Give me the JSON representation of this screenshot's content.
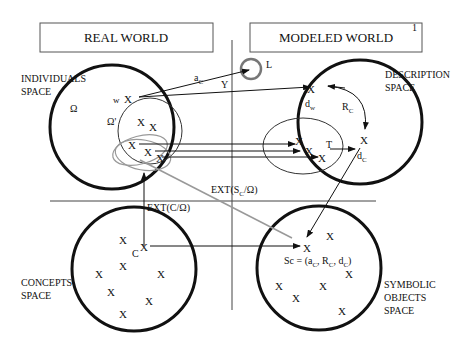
{
  "titles": {
    "real_world": "REAL WORLD",
    "modeled_world": "MODELED WORLD",
    "footnote": "1"
  },
  "spaces": {
    "individuals": [
      "INDIVIDUALS",
      "SPACE"
    ],
    "description": [
      "DESCRIPTION",
      "SPACE"
    ],
    "concepts": [
      "CONCEPTS",
      "SPACE"
    ],
    "symbolic": [
      "SYMBOLIC",
      "OBJECTS",
      "SPACE"
    ]
  },
  "symbols": {
    "omega": "Ω",
    "omega_prime": "Ω'",
    "w": "w",
    "x": "X",
    "c": "C",
    "a_c": "a",
    "a_c_sub": "C",
    "y": "Y",
    "l": "L",
    "d_w": "d",
    "d_w_sub": "w",
    "r_c": "R",
    "r_c_sub": "C",
    "t": "T",
    "d_c": "d",
    "d_c_sub": "C"
  },
  "labels": {
    "ext_sc": "EXT(S",
    "ext_sc_sub": "C",
    "ext_sc_tail": "/Ω)",
    "ext_c": "EXT(C/Ω)",
    "sc_formula": "Sc = (a",
    "sc_sub1": "C",
    "sc_mid1": ", R",
    "sc_sub2": "C",
    "sc_mid2": ", d",
    "sc_sub3": "C",
    "sc_end": ")"
  }
}
